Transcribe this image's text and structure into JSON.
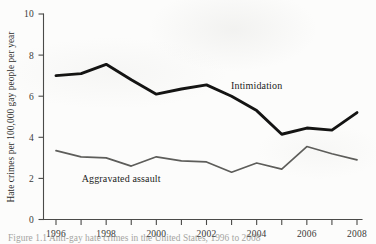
{
  "figure": {
    "y_axis_title": "Hate crimes per 100,000 gay people per year",
    "caption": "Figure 1.1  Anti-gay hate crimes in the United States, 1996 to 2008",
    "colors": {
      "intimidation_line": "#141413",
      "aggravated_assault_line": "#5d5d5a",
      "axis": "#4a4a48",
      "paper": "#fcfcfb"
    }
  },
  "chart_data": {
    "type": "line",
    "title": "",
    "xlabel": "",
    "ylabel": "Hate crimes per 100,000 gay people per year",
    "x": [
      1996,
      1997,
      1998,
      1999,
      2000,
      2001,
      2002,
      2003,
      2004,
      2005,
      2006,
      2007,
      2008
    ],
    "xtick_labels": [
      "1996",
      "1998",
      "2000",
      "2002",
      "2004",
      "2006",
      "2008"
    ],
    "xtick_values": [
      1996,
      1998,
      2000,
      2002,
      2004,
      2006,
      2008
    ],
    "xlim": [
      1996,
      2008
    ],
    "ytick_labels": [
      "0",
      "2",
      "4",
      "6",
      "8",
      "10"
    ],
    "ytick_values": [
      0,
      2,
      4,
      6,
      8,
      10
    ],
    "ylim": [
      0,
      10
    ],
    "grid": false,
    "legend_position": "inline-annotation",
    "series": [
      {
        "name": "Intimidation",
        "label_x": 2004.0,
        "label_y": 6.35,
        "values": [
          7.0,
          7.1,
          7.55,
          6.8,
          6.1,
          6.35,
          6.55,
          6.0,
          5.3,
          4.15,
          4.45,
          4.35,
          5.2
        ]
      },
      {
        "name": "Aggravated assault",
        "label_x": 1998.6,
        "label_y": 1.85,
        "values": [
          3.35,
          3.05,
          3.0,
          2.6,
          3.05,
          2.85,
          2.8,
          2.3,
          2.75,
          2.45,
          3.55,
          3.2,
          2.9
        ]
      }
    ]
  }
}
